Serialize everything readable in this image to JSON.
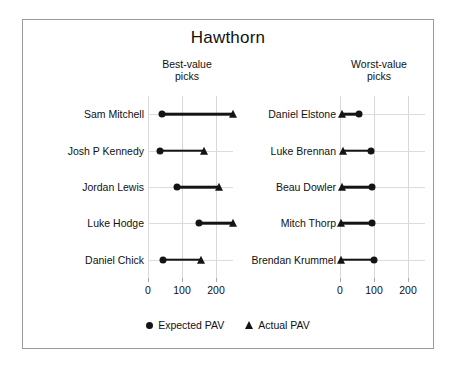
{
  "chart_data": {
    "type": "dumbbell",
    "title": "Hawthorn",
    "xlabel": "",
    "ylabel": "",
    "xlim": [
      0,
      250
    ],
    "x_ticks": [
      0,
      100,
      200
    ],
    "x_tick_labels": [
      "0",
      "100",
      "200"
    ],
    "grid": true,
    "legend_position": "bottom",
    "legend": [
      {
        "label": "Expected PAV",
        "marker": "circle"
      },
      {
        "label": "Actual PAV",
        "marker": "triangle"
      }
    ],
    "series": [
      {
        "name": "Expected PAV",
        "marker": "circle"
      },
      {
        "name": "Actual PAV",
        "marker": "triangle"
      }
    ],
    "panels": [
      {
        "heading": "Best-value\npicks",
        "heading_line1": "Best-value",
        "heading_line2": "picks",
        "categories": [
          "Sam Mitchell",
          "Josh P Kennedy",
          "Jordan Lewis",
          "Luke Hodge",
          "Daniel Chick"
        ],
        "expected_pav": [
          40,
          35,
          85,
          150,
          45
        ],
        "actual_pav": [
          250,
          165,
          210,
          250,
          155
        ],
        "rows": [
          {
            "label": "Sam Mitchell",
            "expected": 40,
            "actual": 250
          },
          {
            "label": "Josh P Kennedy",
            "expected": 35,
            "actual": 165
          },
          {
            "label": "Jordan Lewis",
            "expected": 85,
            "actual": 210
          },
          {
            "label": "Luke Hodge",
            "expected": 150,
            "actual": 250
          },
          {
            "label": "Daniel Chick",
            "expected": 45,
            "actual": 155
          }
        ]
      },
      {
        "heading": "Worst-value\npicks",
        "heading_line1": "Worst-value",
        "heading_line2": "picks",
        "categories": [
          "Daniel Elstone",
          "Luke Brennan",
          "Beau Dowler",
          "Mitch Thorp",
          "Brendan Krummel"
        ],
        "expected_pav": [
          55,
          90,
          95,
          95,
          100
        ],
        "actual_pav": [
          5,
          10,
          5,
          2,
          2
        ],
        "rows": [
          {
            "label": "Daniel Elstone",
            "expected": 55,
            "actual": 5
          },
          {
            "label": "Luke Brennan",
            "expected": 90,
            "actual": 10
          },
          {
            "label": "Beau Dowler",
            "expected": 95,
            "actual": 5
          },
          {
            "label": "Mitch Thorp",
            "expected": 95,
            "actual": 2
          },
          {
            "label": "Brendan Krummel",
            "expected": 100,
            "actual": 2
          }
        ]
      }
    ],
    "colors": {
      "marker": "#141414",
      "connector": "#141414",
      "gridline": "#d8d8d8",
      "border": "#9a9a9a",
      "background": "#ffffff"
    }
  }
}
